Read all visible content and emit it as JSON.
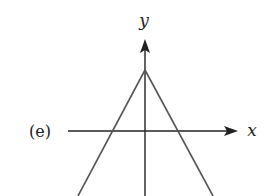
{
  "figure": {
    "panel_label": "(e)",
    "x_axis_label": "x",
    "y_axis_label": "y",
    "colors": {
      "axis": "#222222",
      "curve": "#555555",
      "background": "#ffffff"
    },
    "geometry": {
      "origin": [
        145,
        131
      ],
      "apex": [
        145,
        70
      ],
      "x_axis": {
        "start": [
          68,
          131
        ],
        "end": [
          238,
          131
        ]
      },
      "y_axis": {
        "start": [
          145,
          196
        ],
        "end": [
          145,
          40
        ]
      },
      "left_line": {
        "start": [
          145,
          70
        ],
        "end": [
          78,
          196
        ]
      },
      "right_line": {
        "start": [
          145,
          70
        ],
        "end": [
          213,
          196
        ]
      }
    }
  }
}
